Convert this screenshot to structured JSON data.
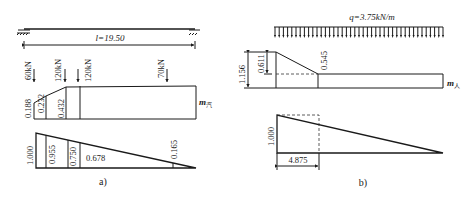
{
  "figure_a": {
    "span_label": "l=19.50",
    "loads": [
      {
        "label": "60kN",
        "x": 34
      },
      {
        "label": "120kN",
        "x": 65
      },
      {
        "label": "120kN",
        "x": 79
      },
      {
        "label": "70kN",
        "x": 167
      }
    ],
    "coefficient_diagram": {
      "label": "m",
      "subscript": "汽",
      "values": [
        "0.188",
        "0.232",
        "0.432"
      ]
    },
    "influence_line": {
      "values": [
        "1.000",
        "0.955",
        "0.750",
        "0.678",
        "0.165"
      ]
    },
    "caption": "a)"
  },
  "figure_b": {
    "load_label": "q=3.75kN/m",
    "coefficient_diagram": {
      "label": "m",
      "subscript": "人",
      "values": [
        "1.156",
        "0.611",
        "0.545"
      ]
    },
    "influence_line": {
      "values": [
        "1.000"
      ],
      "dimension": "4.875"
    },
    "caption": "b)"
  }
}
